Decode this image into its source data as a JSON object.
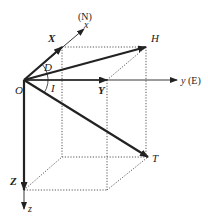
{
  "diagram": {
    "origin_label": "O",
    "axes": {
      "x": {
        "label": "x",
        "direction_label": "(N)"
      },
      "y": {
        "label": "y",
        "direction_label": "(E)"
      },
      "z": {
        "label": "z"
      }
    },
    "components": {
      "X": "X",
      "Y": "Y",
      "Z": "Z",
      "H": "H",
      "T": "T"
    },
    "angles": {
      "declination": "D",
      "inclination": "I"
    },
    "colors": {
      "line": "#222222",
      "dotted": "#444444",
      "background": "#ffffff"
    }
  }
}
